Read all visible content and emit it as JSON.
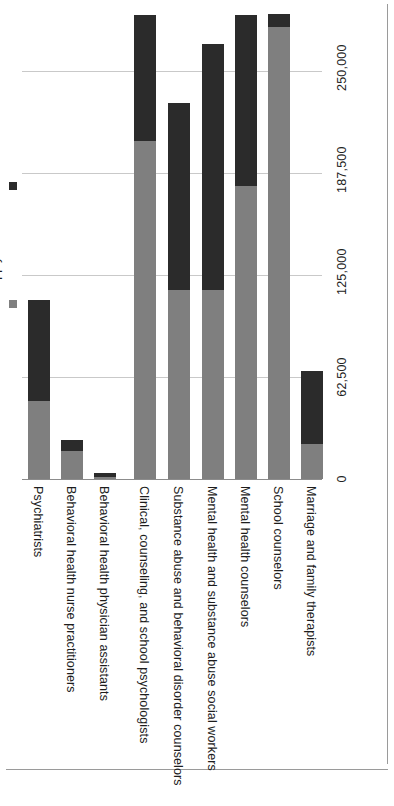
{
  "chart_data": {
    "type": "bar",
    "orientation": "vertical-bars-rotated-page",
    "title": "",
    "subtitle": "",
    "xlabel": "",
    "ylabel": "",
    "grid": true,
    "legend_position": "left",
    "ylim": [
      0,
      250000
    ],
    "yticks": [
      "0",
      "62,500",
      "125,000",
      "187,500",
      "250,000"
    ],
    "ytick_values": [
      0,
      62500,
      125000,
      187500,
      250000
    ],
    "categories": [
      "Psychiatrists",
      "Behavioral health nurse practitioners",
      "Behavioral health physician assistants",
      "Clinical, counseling, and school psychologists",
      "Substance abuse and behavioral disorder counselors",
      "Mental health and substance abuse social workers",
      "Mental health counselors",
      "School counselors",
      "Marriage and family therapists"
    ],
    "series": [
      {
        "name": "Supply",
        "color": "#7f7f7f",
        "values": [
          47800,
          17100,
          1200,
          207000,
          115800,
          115800,
          179600,
          277000,
          21400
        ]
      },
      {
        "name": "Demand",
        "color": "#2b2b2b",
        "values": [
          109600,
          23900,
          3700,
          284300,
          230400,
          266600,
          284300,
          284900,
          66200
        ]
      }
    ],
    "legend": [
      {
        "label": "Demand",
        "color": "#2b2b2b",
        "swatch": "square-swatch"
      },
      {
        "label": "Supply",
        "color": "#7f7f7f",
        "swatch": "square-swatch"
      }
    ]
  }
}
